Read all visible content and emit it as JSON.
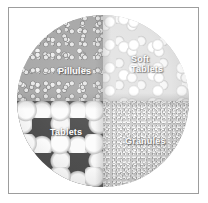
{
  "figure": {
    "alt_description": "Circular photograph of pharmaceutical solid dosage forms divided into four quadrants",
    "border_color": "#9d9d9d",
    "background_color": "#ffffff",
    "label_color": "#ffffff"
  },
  "regions": [
    {
      "id": "pellets",
      "label": "Pillules",
      "position": "top-left",
      "description": "small spherical mid-grey pellets",
      "tone": "#a9a9a9"
    },
    {
      "id": "soft-tablets",
      "label": "Soft\nTablets",
      "position": "top-right",
      "description": "bright white irregular soft tablets",
      "tone": "#e4e4e4"
    },
    {
      "id": "tablets",
      "label": "Tablets",
      "position": "bottom-left",
      "description": "large round white tablets on dark background",
      "tone": "#4e4e4e"
    },
    {
      "id": "granules",
      "label": "Granules",
      "position": "bottom-right",
      "description": "fine pale granular powder",
      "tone": "#cdcdcd"
    }
  ]
}
